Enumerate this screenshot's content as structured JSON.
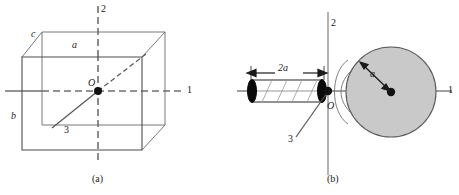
{
  "figure": {
    "panels": [
      {
        "id": "a",
        "caption": "(a)",
        "shape_name": "rectangular-block",
        "axes": [
          {
            "name": "axis-1",
            "label": "1",
            "orientation": "horizontal-right"
          },
          {
            "name": "axis-2",
            "label": "2",
            "orientation": "vertical-up"
          },
          {
            "name": "axis-3",
            "label": "3",
            "orientation": "diagonal-depth"
          }
        ],
        "origin_label": "O",
        "edge_labels": [
          {
            "name": "edge-a",
            "label": "a",
            "position": "top-front"
          },
          {
            "name": "edge-b",
            "label": "b",
            "position": "left-front"
          },
          {
            "name": "edge-c",
            "label": "c",
            "position": "top-left-depth"
          }
        ]
      },
      {
        "id": "b",
        "caption": "(b)",
        "shape_name": "cylinder-and-sphere",
        "axes": [
          {
            "name": "axis-1",
            "label": "1",
            "orientation": "horizontal-right"
          },
          {
            "name": "axis-2",
            "label": "2",
            "orientation": "vertical-up"
          },
          {
            "name": "axis-3",
            "label": "3",
            "orientation": "diagonal-down-left"
          }
        ],
        "origin_label": "O",
        "dimension_labels": [
          {
            "name": "cylinder-length",
            "label": "2a"
          },
          {
            "name": "sphere-radius",
            "label": "a"
          }
        ]
      }
    ],
    "colors": {
      "stroke": "#404040",
      "axis": "#707070",
      "sphere_fill": "#c8c8c8",
      "cap_fill": "#000000",
      "text": "#1a1a1a",
      "background": "#ffffff"
    }
  }
}
